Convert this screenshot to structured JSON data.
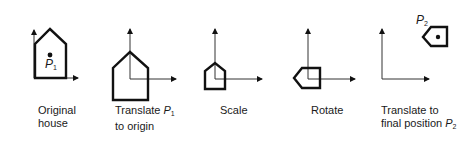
{
  "figure": {
    "panels": [
      {
        "id": "original",
        "caption_line1": "Original",
        "caption_line2": "house",
        "point_label": "P",
        "point_sub": "1"
      },
      {
        "id": "translate-origin",
        "caption_line1_pre": "Translate ",
        "caption_var": "P",
        "caption_sub": "1",
        "caption_line2": "to origin"
      },
      {
        "id": "scale",
        "caption_line1": "Scale"
      },
      {
        "id": "rotate",
        "caption_line1": "Rotate"
      },
      {
        "id": "translate-final",
        "caption_line1": "Translate to",
        "caption_line2_pre": "final position ",
        "caption_var": "P",
        "caption_sub": "2",
        "point_label": "P",
        "point_sub": "2"
      }
    ],
    "colors": {
      "stroke": "#111111",
      "axis": "#333333",
      "background": "#ffffff"
    }
  }
}
